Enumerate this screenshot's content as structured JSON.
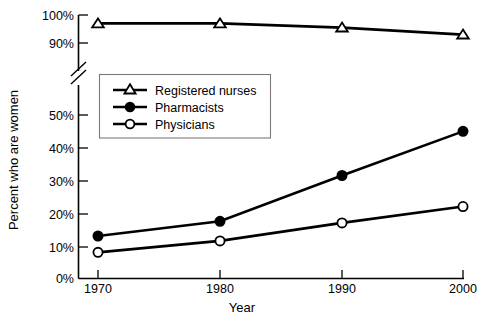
{
  "chart_data": {
    "type": "line",
    "title": "",
    "xlabel": "Year",
    "ylabel": "Percent who are women",
    "categories": [
      1970,
      1980,
      1990,
      2000
    ],
    "x_tick_labels": [
      "1970",
      "1980",
      "1990",
      "2000"
    ],
    "y_tick_labels": [
      "0%",
      "10%",
      "20%",
      "30%",
      "40%",
      "50%",
      "90%",
      "100%"
    ],
    "y_tick_values": [
      0,
      10,
      20,
      30,
      40,
      50,
      90,
      100
    ],
    "ylim": [
      0,
      100
    ],
    "axis_break": true,
    "axis_break_between": [
      50,
      90
    ],
    "grid": false,
    "legend_position": "upper-left-inside",
    "series": [
      {
        "name": "Registered nurses",
        "marker": "open-triangle",
        "values": [
          97,
          97,
          95.5,
          93
        ]
      },
      {
        "name": "Pharmacists",
        "marker": "filled-circle",
        "values": [
          13,
          17.5,
          31.5,
          45
        ]
      },
      {
        "name": "Physicians",
        "marker": "open-circle",
        "values": [
          8,
          11.5,
          17,
          22
        ]
      }
    ]
  },
  "legend": {
    "entries": [
      {
        "label": "Registered nurses"
      },
      {
        "label": "Pharmacists"
      },
      {
        "label": "Physicians"
      }
    ]
  },
  "axes": {
    "y_title": "Percent who are women",
    "x_title": "Year"
  },
  "colors": {
    "line": "#000000",
    "background": "#ffffff",
    "legend_border": "#7a7a7a"
  }
}
